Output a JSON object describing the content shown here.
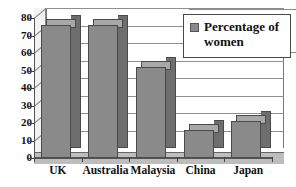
{
  "chart_data": {
    "type": "bar",
    "title": "",
    "xlabel": "",
    "ylabel": "",
    "categories": [
      "UK",
      "Australia",
      "Malaysia",
      "China",
      "Japan"
    ],
    "values": [
      76,
      76,
      52,
      16,
      21
    ],
    "series": [
      {
        "name": "Percentage of women",
        "values": [
          76,
          76,
          52,
          16,
          21
        ]
      }
    ],
    "ylim": [
      0,
      80
    ],
    "ytick_labels": [
      "0",
      "10",
      "20",
      "30",
      "40",
      "50",
      "60",
      "70",
      "80"
    ],
    "ytick_values": [
      0,
      10,
      20,
      30,
      40,
      50,
      60,
      70,
      80
    ],
    "grid": true,
    "legend": {
      "position": "top-right",
      "entries": [
        {
          "label": "Percentage of women",
          "swatch_color": "#8a8a8a"
        }
      ]
    },
    "style": {
      "effect": "3d",
      "bar_front_color": "#8a8a8a",
      "bar_side_color": "#6e6e6e",
      "bar_top_color": "#a8a8a8",
      "bar_outline_color": "#4a4a4a",
      "gridline_color": "#8f8f8f",
      "axis_color": "#555555",
      "background_color": "#ffffff",
      "floor_color": "#bdbdbd",
      "text_color": "#111111"
    }
  }
}
